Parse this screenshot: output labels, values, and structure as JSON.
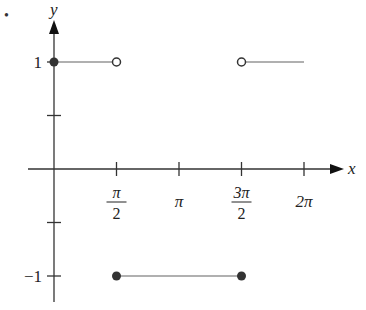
{
  "chart_data": {
    "type": "line",
    "title": "",
    "xlabel": "x",
    "ylabel": "y",
    "x_ticks": [
      {
        "value": 1.5708,
        "label_num": "π",
        "label_den": "2",
        "fraction": true
      },
      {
        "value": 3.1416,
        "label": "π",
        "fraction": false
      },
      {
        "value": 4.7124,
        "label_num": "3π",
        "label_den": "2",
        "fraction": true
      },
      {
        "value": 6.2832,
        "label": "2π",
        "fraction": false
      }
    ],
    "y_ticks": [
      {
        "value": 1,
        "label": "1"
      },
      {
        "value": 0.5,
        "label": ""
      },
      {
        "value": -0.5,
        "label": ""
      },
      {
        "value": -1,
        "label": "−1"
      }
    ],
    "xlim": [
      -0.8,
      7.5
    ],
    "ylim": [
      -1.25,
      1.4
    ],
    "grid": false,
    "legend": null,
    "series": [
      {
        "name": "segment-1",
        "x": [
          0,
          1.5708
        ],
        "y": [
          1,
          1
        ],
        "start": "closed",
        "end": "open"
      },
      {
        "name": "segment-2",
        "x": [
          1.5708,
          4.7124
        ],
        "y": [
          -1,
          -1
        ],
        "start": "closed",
        "end": "closed"
      },
      {
        "name": "segment-3",
        "x": [
          4.7124,
          6.2832
        ],
        "y": [
          1,
          1
        ],
        "start": "open",
        "end": "none"
      }
    ],
    "colors": {
      "axis": "#333333",
      "segment": "#b0b0b0",
      "point": "#333333"
    }
  }
}
